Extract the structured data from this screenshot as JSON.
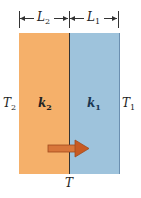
{
  "dimensions": {
    "left": {
      "symbol": "L",
      "sub": "2"
    },
    "right": {
      "symbol": "L",
      "sub": "1"
    }
  },
  "slabs": [
    {
      "id": "slab-2",
      "k": "k",
      "k_sub": "2",
      "color": "#f5b06a"
    },
    {
      "id": "slab-1",
      "k": "k",
      "k_sub": "1",
      "color": "#9ec3dc"
    }
  ],
  "temperatures": {
    "left": {
      "symbol": "T",
      "sub": "2"
    },
    "right": {
      "symbol": "T",
      "sub": "1"
    },
    "interface": "T"
  },
  "arrow": {
    "direction": "right",
    "color": "#d0652a",
    "meaning": "heat-flow"
  }
}
